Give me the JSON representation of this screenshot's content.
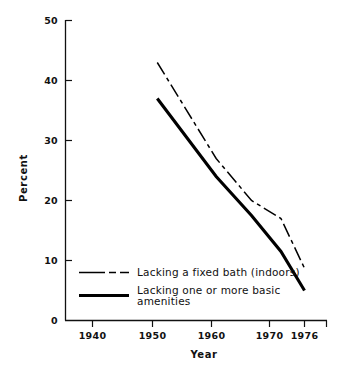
{
  "chart_data": {
    "type": "line",
    "title": "",
    "xlabel": "Year",
    "ylabel": "Percent",
    "xlim": [
      1936,
      1979
    ],
    "ylim": [
      0,
      50
    ],
    "xticks": [
      1940,
      1950,
      1960,
      1970,
      1976
    ],
    "xticklabels": [
      "1940",
      "1950",
      "1960",
      "1970",
      "1976"
    ],
    "yticks": [
      0,
      10,
      20,
      30,
      40,
      50
    ],
    "yticklabels": [
      "0",
      "10",
      "20",
      "30",
      "40",
      "50"
    ],
    "grid": false,
    "legend_position": "lower-left-inside",
    "series": [
      {
        "name": "Lacking a fixed bath (indoors)",
        "style": "dash-dot",
        "color": "#000000",
        "width": 1.4,
        "x": [
          1951,
          1961,
          1967,
          1972,
          1976
        ],
        "y": [
          43.0,
          27.0,
          20.0,
          17.0,
          8.7
        ]
      },
      {
        "name": "Lacking one or more basic amenities",
        "style": "solid",
        "color": "#000000",
        "width": 3.0,
        "x": [
          1951,
          1961,
          1967,
          1972,
          1976
        ],
        "y": [
          37.0,
          24.0,
          17.5,
          11.5,
          5.0
        ]
      }
    ]
  },
  "axes": {
    "ylabel": "Percent",
    "xlabel": "Year",
    "yticklabels": [
      "50",
      "40",
      "30",
      "20",
      "10",
      "0"
    ],
    "xticklabels": [
      "1940",
      "1950",
      "1960",
      "1970",
      "1976"
    ]
  },
  "legend": {
    "entries": [
      {
        "label": "Lacking a fixed bath (indoors)",
        "line_style": "dash-dot",
        "color": "#000000"
      },
      {
        "label_line_1": "Lacking one or more basic",
        "label_line_2": "amenities",
        "line_style": "solid",
        "color": "#000000"
      }
    ]
  },
  "colors": {
    "background": "#ffffff",
    "axis": "#111111",
    "ink": "#000000"
  }
}
